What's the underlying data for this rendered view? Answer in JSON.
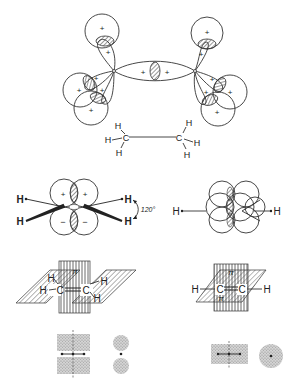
{
  "figure": {
    "panels": [
      {
        "id": "ethane-sp3",
        "orbital_signs": [
          "+",
          "+",
          "+",
          "+",
          "+",
          "+",
          "+",
          "+",
          "+",
          "+",
          "+",
          "+",
          "+",
          "+"
        ],
        "molecule": {
          "atoms": [
            "H",
            "H",
            "H",
            "C",
            "C",
            "H",
            "H",
            "H"
          ]
        }
      },
      {
        "id": "ethylene-p-orbitals-side",
        "upper_signs": [
          "+",
          "+"
        ],
        "lower_signs": [
          "−",
          "−"
        ],
        "left_atoms": [
          "H",
          "H"
        ],
        "right_atoms": [
          "H",
          "H"
        ],
        "angle_label": "120°"
      },
      {
        "id": "ethylene-p-orbitals-end",
        "left_atom": "H",
        "right_atom": "H"
      },
      {
        "id": "ethylene-pi-planes",
        "pi_label": "π",
        "atoms": {
          "c1": "C",
          "c2": "C",
          "h_tl": "H",
          "h_bl": "H",
          "h_tr": "H",
          "h_br": "H"
        }
      },
      {
        "id": "acetylene-pi-planes",
        "pi_label_top": "π",
        "pi_label_bottom": "π",
        "atoms": {
          "h_left": "H",
          "c1": "C",
          "c2": "C",
          "h_right": "H"
        }
      },
      {
        "id": "ethylene-density-side"
      },
      {
        "id": "ethylene-density-end"
      },
      {
        "id": "acetylene-density-side"
      },
      {
        "id": "acetylene-density-end"
      }
    ]
  }
}
